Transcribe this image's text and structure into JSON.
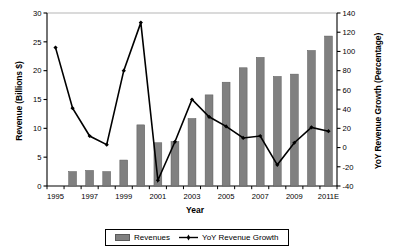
{
  "chart_data": {
    "type": "bar",
    "title": "",
    "xlabel": "Year",
    "ylabel": "Revenue (Billions $)",
    "ylabel_secondary": "YoY Revenue Growth (Percentage)",
    "categories": [
      "1995",
      "1996",
      "1997",
      "1998",
      "1999",
      "2000",
      "2001",
      "2002",
      "2003",
      "2004",
      "2005",
      "2006",
      "2007",
      "2008",
      "2009",
      "2010",
      "2011E"
    ],
    "xtick_labels": [
      "1995",
      "1997",
      "1999",
      "2001",
      "2003",
      "2005",
      "2007",
      "2009",
      "2011E"
    ],
    "ylim": [
      0,
      30
    ],
    "yticks": [
      0,
      5,
      10,
      15,
      20,
      25,
      30
    ],
    "ylim_secondary": [
      -40,
      140
    ],
    "yticks_secondary": [
      -40,
      -20,
      0,
      20,
      40,
      60,
      80,
      100,
      120,
      140
    ],
    "grid": false,
    "legend_position": "bottom",
    "series": [
      {
        "name": "Revenues",
        "type": "bar",
        "axis": "left",
        "unit": "Billions $",
        "color": "#808080",
        "values": [
          null,
          2.5,
          2.7,
          2.5,
          4.5,
          10.6,
          7.5,
          7.7,
          11.7,
          15.8,
          18.0,
          20.5,
          22.3,
          19.0,
          19.4,
          23.5,
          26.0
        ]
      },
      {
        "name": "YoY Revenue Growth",
        "type": "line",
        "axis": "right",
        "unit": "Percentage",
        "color": "#000000",
        "values": [
          104,
          41,
          12,
          3,
          80,
          130,
          -34,
          6,
          50,
          32,
          22,
          10,
          12,
          -18,
          5,
          21,
          17
        ]
      }
    ]
  },
  "legend": {
    "entries": [
      {
        "label": "Revenues",
        "marker": "bar-swatch-icon"
      },
      {
        "label": "YoY Revenue Growth",
        "marker": "line-marker-icon"
      }
    ]
  },
  "axes": {
    "x_title": "Year",
    "y_left_title": "Revenue (Billions $)",
    "y_right_title": "YoY Revenue Growth (Percentage)"
  }
}
